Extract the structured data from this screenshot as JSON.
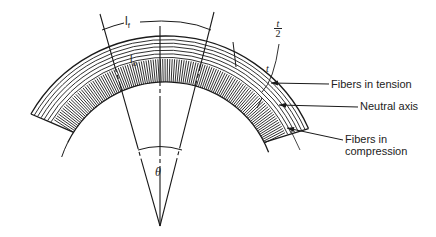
{
  "diagram": {
    "type": "bending of a beam — fiber strain",
    "labels": {
      "lf": "l",
      "lf_sub": "f",
      "lo": "l",
      "lo_sub": "o",
      "t": "t",
      "t_half_num": "t",
      "t_half_den": "2",
      "theta": "θ"
    },
    "callouts": [
      {
        "text": "Fibers in tension"
      },
      {
        "text": "Neutral axis"
      },
      {
        "text": "Fibers in compression",
        "line1": "Fibers in",
        "line2": "compression"
      }
    ],
    "colors": {
      "stroke": "#1a1a1a",
      "background": "#ffffff"
    }
  }
}
